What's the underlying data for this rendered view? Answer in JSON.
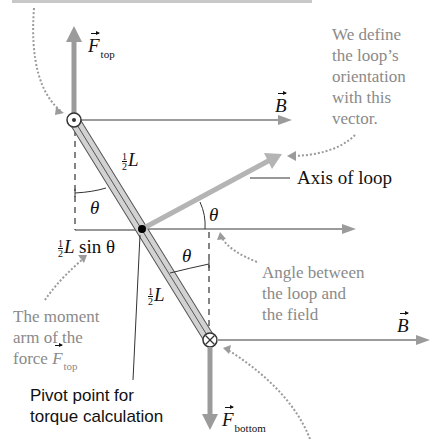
{
  "diagram": {
    "colors": {
      "arrow": "#9b9b9b",
      "loop_fill": "#d2d2d2",
      "loop_edge": "#555555",
      "note_text": "#8a8a8a",
      "dark_text": "#111111"
    },
    "labels": {
      "f_top_symbol": "F",
      "f_top_sub": "top",
      "b_top_symbol": "B",
      "b_bottom_symbol": "B",
      "f_bottom_symbol": "F",
      "f_bottom_sub": "bottom",
      "half_num": "1",
      "half_den": "2",
      "L": "L",
      "theta": "θ",
      "sin_theta": "sin θ",
      "axis_of_loop": "Axis of loop",
      "pivot_line1": "Pivot point for",
      "pivot_line2": "torque calculation"
    },
    "notes": {
      "orientation": [
        "We define",
        "the loop’s",
        "orientation",
        "with this",
        "vector."
      ],
      "angle": [
        "Angle between",
        "the loop and",
        "the field"
      ],
      "moment_arm": [
        "The moment",
        "arm of the",
        "force"
      ],
      "moment_arm_force_symbol": "F",
      "moment_arm_force_sub": "top"
    }
  }
}
